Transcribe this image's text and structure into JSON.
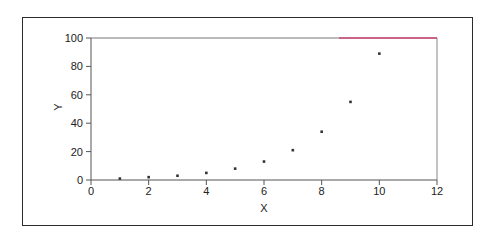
{
  "chart_data": {
    "type": "scatter",
    "title": "",
    "xlabel": "X",
    "ylabel": "Y",
    "xlim": [
      0,
      12
    ],
    "ylim": [
      0,
      100
    ],
    "x_ticks": [
      0,
      2,
      4,
      6,
      8,
      10,
      12
    ],
    "y_ticks": [
      0,
      20,
      40,
      60,
      80,
      100
    ],
    "grid": false,
    "legend": null,
    "series": [
      {
        "name": "Y",
        "x": [
          1,
          2,
          3,
          4,
          5,
          6,
          7,
          8,
          9,
          10
        ],
        "y": [
          1,
          2,
          3,
          5,
          8,
          13,
          21,
          34,
          55,
          89
        ],
        "marker": "square",
        "color": "#333333"
      }
    ],
    "colors": {
      "axis": "#555555",
      "frame": "#2b2b2b",
      "top_accent": "#d6336c"
    }
  }
}
